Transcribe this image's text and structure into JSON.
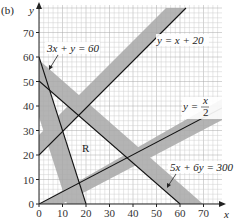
{
  "part_label": "(b)",
  "chart_data": {
    "type": "line",
    "title": "",
    "xlabel": "x",
    "ylabel": "y",
    "xlim": [
      0,
      78
    ],
    "ylim": [
      0,
      81
    ],
    "grid": true,
    "x_ticks": [
      0,
      10,
      20,
      30,
      40,
      50,
      60,
      70
    ],
    "y_ticks": [
      0,
      10,
      20,
      30,
      40,
      50,
      60,
      70
    ],
    "series": [
      {
        "name": "y = x + 20",
        "points": [
          [
            0,
            20
          ],
          [
            60,
            80
          ]
        ],
        "shaded_side": "above"
      },
      {
        "name": "3x + y = 60",
        "points": [
          [
            0,
            60
          ],
          [
            20,
            0
          ]
        ],
        "shaded_side": "below"
      },
      {
        "name": "5x + 6y = 300",
        "points": [
          [
            0,
            50
          ],
          [
            60,
            0
          ]
        ],
        "shaded_side": "above"
      },
      {
        "name": "y = x/2",
        "points": [
          [
            0,
            0
          ],
          [
            78,
            39
          ]
        ],
        "shaded_side": "below"
      }
    ],
    "region_label": "R",
    "annotations": [
      "3x + y = 60",
      "y = x + 20",
      "y = x/2",
      "5x + 6y = 300",
      "R"
    ]
  },
  "labels": {
    "eq1": "y = x + 20",
    "eq2": "3x + y = 60",
    "eq3": "5x + 6y = 300",
    "eq4_left": "y =",
    "eq4_num": "x",
    "eq4_den": "2",
    "region": "R",
    "xaxis": "x",
    "yaxis": "y",
    "xticks": [
      "0",
      "10",
      "20",
      "30",
      "40",
      "50",
      "60",
      "70"
    ],
    "yticks": [
      "0",
      "10",
      "20",
      "30",
      "40",
      "50",
      "60",
      "70"
    ]
  }
}
